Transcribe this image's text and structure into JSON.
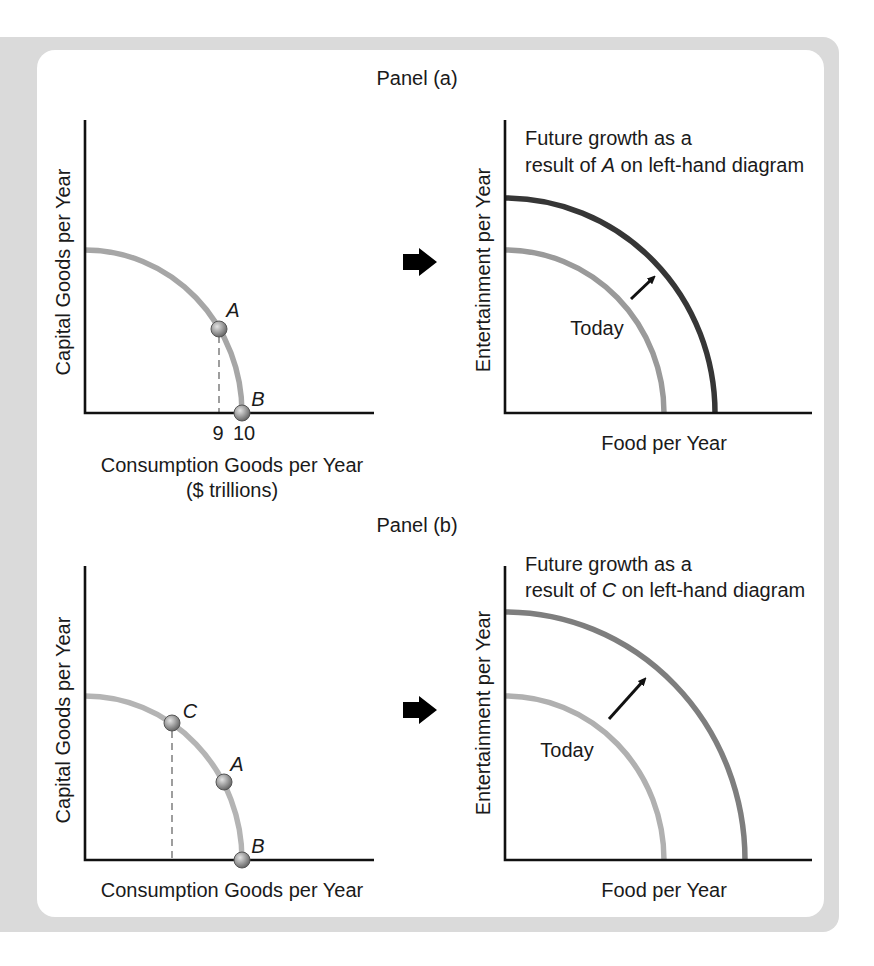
{
  "figure": {
    "panels": [
      {
        "title": "Panel (a)",
        "left_diagram": {
          "y_axis_label": "Capital Goods per Year",
          "x_axis_label": "Consumption Goods per Year",
          "x_axis_unit": "($ trillions)",
          "x_ticks": [
            "9",
            "10"
          ],
          "points": [
            {
              "label": "A",
              "x_value": 9
            },
            {
              "label": "B",
              "x_value": 10
            }
          ],
          "curve_color": "#a6a6a6"
        },
        "transition_icon": "arrow-right-icon",
        "right_diagram": {
          "caption_line1": "Future growth as a",
          "caption_line2_prefix": "result of ",
          "caption_line2_point": "A",
          "caption_line2_suffix": " on left-hand diagram",
          "y_axis_label": "Entertainment per Year",
          "x_axis_label": "Food per Year",
          "today_label": "Today",
          "today_curve_color": "#9a9a9a",
          "future_curve_color": "#363636"
        }
      },
      {
        "title": "Panel (b)",
        "left_diagram": {
          "y_axis_label": "Capital Goods per Year",
          "x_axis_label": "Consumption Goods per Year",
          "points": [
            {
              "label": "C"
            },
            {
              "label": "A"
            },
            {
              "label": "B"
            }
          ],
          "curve_color": "#b4b4b4"
        },
        "transition_icon": "arrow-right-icon",
        "right_diagram": {
          "caption_line1": "Future growth as a",
          "caption_line2_prefix": "result of ",
          "caption_line2_point": "C",
          "caption_line2_suffix": " on left-hand diagram",
          "y_axis_label": "Entertainment per Year",
          "x_axis_label": "Food per Year",
          "today_label": "Today",
          "today_curve_color": "#b0b0b0",
          "future_curve_color": "#7e7e7e"
        }
      }
    ],
    "colors": {
      "frame": "#dadada",
      "background": "#ffffff",
      "axis": "#111111",
      "marker": "#8c8c8c"
    }
  }
}
